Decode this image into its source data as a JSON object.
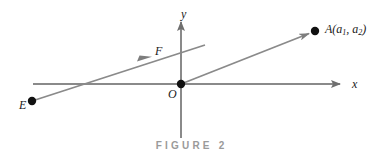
{
  "figure": {
    "caption": "FIGURE 2",
    "caption_color": "#9a9a9a",
    "background_color": "#ffffff",
    "axis_color": "#8a8a8a",
    "vector_color": "#8a8a8a",
    "point_color": "#111111",
    "label_color": "#1a1a1a"
  },
  "axes": {
    "x_label": "x",
    "y_label": "y",
    "origin_label": "O",
    "x_axis": {
      "x1": 33,
      "y1": 84,
      "x2": 345,
      "y2": 84,
      "arrow": "right"
    },
    "y_axis": {
      "x1": 181,
      "y1": 138,
      "x2": 181,
      "y2": 17,
      "arrow": "up"
    }
  },
  "points": [
    {
      "name": "A",
      "label_prefix": "A(a",
      "label_sub1": "1",
      "label_mid": ", a",
      "label_sub2": "2",
      "label_suffix": ")",
      "x": 315,
      "y": 31
    },
    {
      "name": "E",
      "label": "E",
      "x": 32,
      "y": 101
    },
    {
      "name": "O",
      "label": "O",
      "x": 181,
      "y": 84
    }
  ],
  "vectors": [
    {
      "name": "EF",
      "label": "F",
      "x1": 32,
      "y1": 101,
      "x2": 205,
      "y2": 45,
      "arrow_at_x": 150,
      "arrow_at_y": 57
    },
    {
      "name": "OA",
      "label": "A",
      "x1": 181,
      "y1": 84,
      "x2": 315,
      "y2": 31,
      "arrow_at_x": 303,
      "arrow_at_y": 36
    }
  ]
}
